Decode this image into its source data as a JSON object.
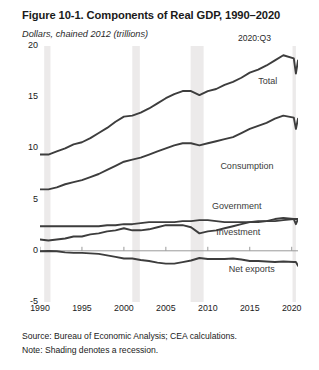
{
  "figure": {
    "title": "Figure 10-1. Components of Real GDP, 1990–2020",
    "subtitle": "Dollars, chained 2012 (trillions)",
    "end_annotation": "2020:Q3",
    "source": "Source: Bureau of Economic Analysis; CEA calculations.",
    "note": "Note: Shading denotes a recession."
  },
  "chart_data": {
    "type": "line",
    "title": "Figure 10-1. Components of Real GDP, 1990–2020",
    "subtitle": "Dollars, chained 2012 (trillions)",
    "xlabel": "",
    "ylabel": "Dollars, chained 2012 (trillions)",
    "xlim": [
      1990,
      2020.75
    ],
    "ylim": [
      -5,
      20
    ],
    "yticks": [
      20,
      15,
      10,
      5,
      0,
      -5
    ],
    "xticks": [
      1990,
      1995,
      2000,
      2005,
      2010,
      2015,
      2020
    ],
    "grid": false,
    "legend": "inline-labels",
    "line_color": "#3d3d3d",
    "recession_color": "#eceaea",
    "recessions": [
      {
        "start": 1990.5,
        "end": 1991.25
      },
      {
        "start": 2001.0,
        "end": 2001.9
      },
      {
        "start": 2007.95,
        "end": 2009.5
      },
      {
        "start": 2020.1,
        "end": 2020.5
      }
    ],
    "x": [
      1990,
      1991,
      1992,
      1993,
      1994,
      1995,
      1996,
      1997,
      1998,
      1999,
      2000,
      2001,
      2002,
      2003,
      2004,
      2005,
      2006,
      2007,
      2008,
      2009,
      2010,
      2011,
      2012,
      2013,
      2014,
      2015,
      2016,
      2017,
      2018,
      2019,
      2020.25,
      2020.5,
      2020.75
    ],
    "series": [
      {
        "name": "Total",
        "label": "Total",
        "values": [
          9.4,
          9.4,
          9.7,
          10.0,
          10.4,
          10.6,
          11.0,
          11.5,
          12.0,
          12.6,
          13.1,
          13.2,
          13.5,
          13.9,
          14.4,
          14.9,
          15.3,
          15.6,
          15.6,
          15.2,
          15.6,
          15.8,
          16.2,
          16.5,
          16.9,
          17.4,
          17.7,
          18.1,
          18.6,
          19.1,
          18.8,
          17.3,
          18.6
        ],
        "label_position": {
          "x": 2016.0,
          "y": 16.5
        }
      },
      {
        "name": "Consumption",
        "label": "Consumption",
        "values": [
          6.0,
          6.0,
          6.2,
          6.5,
          6.7,
          6.9,
          7.2,
          7.5,
          7.9,
          8.3,
          8.7,
          8.9,
          9.1,
          9.4,
          9.7,
          10.0,
          10.3,
          10.5,
          10.5,
          10.3,
          10.5,
          10.7,
          10.9,
          11.1,
          11.5,
          11.9,
          12.2,
          12.5,
          12.9,
          13.2,
          13.0,
          11.9,
          12.9
        ],
        "label_position": {
          "x": 2011.5,
          "y": 8.2
        }
      },
      {
        "name": "Government",
        "label": "Government",
        "values": [
          2.4,
          2.4,
          2.4,
          2.4,
          2.4,
          2.4,
          2.4,
          2.4,
          2.5,
          2.5,
          2.6,
          2.6,
          2.7,
          2.8,
          2.8,
          2.8,
          2.8,
          2.9,
          2.9,
          3.0,
          3.0,
          2.9,
          2.8,
          2.8,
          2.8,
          2.8,
          2.9,
          2.9,
          2.9,
          3.0,
          3.1,
          3.1,
          3.1
        ],
        "label_position": {
          "x": 2010.5,
          "y": 4.3
        }
      },
      {
        "name": "Investment",
        "label": "Investment",
        "values": [
          1.1,
          1.0,
          1.1,
          1.2,
          1.4,
          1.4,
          1.6,
          1.7,
          1.9,
          2.0,
          2.2,
          2.0,
          2.0,
          2.1,
          2.3,
          2.5,
          2.5,
          2.5,
          2.3,
          1.7,
          1.9,
          2.0,
          2.2,
          2.4,
          2.6,
          2.8,
          2.8,
          2.9,
          3.1,
          3.2,
          3.1,
          2.6,
          3.1
        ],
        "label_position": {
          "x": 2011.0,
          "y": 1.7
        }
      },
      {
        "name": "Net exports",
        "label": "Net exports",
        "values": [
          -0.05,
          -0.02,
          -0.05,
          -0.15,
          -0.2,
          -0.2,
          -0.25,
          -0.3,
          -0.45,
          -0.6,
          -0.75,
          -0.75,
          -0.9,
          -1.0,
          -1.15,
          -1.25,
          -1.25,
          -1.1,
          -0.95,
          -0.7,
          -0.8,
          -0.8,
          -0.8,
          -0.75,
          -0.85,
          -1.0,
          -1.0,
          -1.05,
          -1.1,
          -1.05,
          -1.1,
          -1.1,
          -1.45
        ],
        "label_position": {
          "x": 2012.5,
          "y": -1.9
        }
      }
    ]
  }
}
